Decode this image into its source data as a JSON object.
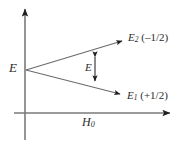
{
  "figure": {
    "name": "zeeman-energy-level-splitting-diagram",
    "background_color": "#ffffff",
    "line_color": "#6b6b6b",
    "text_color": "#2b2b2b",
    "axes": {
      "y_axis": {
        "name": "energy-axis",
        "arrow": "up",
        "label": ""
      },
      "x_axis": {
        "name": "magnetic-field-axis",
        "arrow": "right",
        "label_html": "H",
        "label_sub": "0"
      }
    },
    "labels": {
      "origin_energy": "E",
      "splitting_gap": "E",
      "upper_level_symbol": "E",
      "upper_level_sub": "2",
      "upper_level_value": "(–1/2)",
      "lower_level_symbol": "E",
      "lower_level_sub": "1",
      "lower_level_value": "(+1/2)"
    },
    "geometry": {
      "vertex_x": 26,
      "vertex_y": 70,
      "upper_tip_x": 126,
      "upper_tip_y": 39,
      "lower_tip_x": 124,
      "lower_tip_y": 96,
      "gap_arrow_x": 95,
      "gap_arrow_top_y": 52,
      "gap_arrow_bottom_y": 86
    }
  }
}
